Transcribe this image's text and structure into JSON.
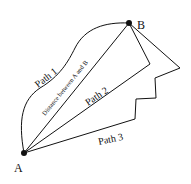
{
  "diagram": {
    "points": {
      "A": {
        "label": "A",
        "x": 24,
        "y": 153
      },
      "B": {
        "label": "B",
        "x": 129,
        "y": 23
      }
    },
    "paths": [
      {
        "label": "Path 1",
        "type": "curve"
      },
      {
        "label": "Path 2",
        "type": "polyline"
      },
      {
        "label": "Path 3",
        "type": "polyline"
      }
    ],
    "straight_line_label": "Distance between A and B",
    "colors": {
      "stroke": "#111111",
      "background": "#ffffff"
    }
  }
}
